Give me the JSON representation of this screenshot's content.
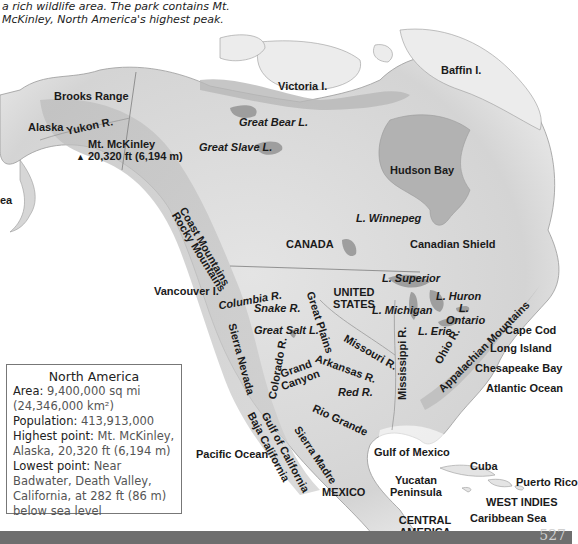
{
  "caption": {
    "text": "a rich wildlife area. The park contains Mt. McKinley, North America's highest peak."
  },
  "factbox": {
    "title": "North America",
    "area_label": "Area:",
    "area_value": "9,400,000 sq mi (24,346,000 km²)",
    "population_label": "Population:",
    "population_value": "413,913,000",
    "highest_label": "Highest point:",
    "highest_value": "Mt. McKinley, Alaska, 20,320 ft (6,194 m)",
    "lowest_label": "Lowest point:",
    "lowest_value": "Near Badwater, Death Valley, California, at 282 ft (86 m) below sea level"
  },
  "labels": {
    "victoria": "Victoria I.",
    "baffin": "Baffin I.",
    "brooks": "Brooks Range",
    "alaska": "Alaska",
    "yukon": "Yukon R.",
    "mckinley": "Mt. McKinley",
    "mckinley_elev": "20,320 ft (6,194 m)",
    "great_bear": "Great Bear L.",
    "great_slave": "Great Slave L.",
    "hudson": "Hudson Bay",
    "sea_partial": "ea",
    "rocky": "Rocky Mountains",
    "coast": "Coast Mountains",
    "winnepeg": "L. Winnepeg",
    "canada": "CANADA",
    "canadian_shield": "Canadian Shield",
    "vancouver": "Vancouver I.",
    "columbia": "Columbia R.",
    "snake": "Snake R.",
    "great_salt": "Great Salt L.",
    "sierra_nevada": "Sierra Nevada",
    "great_plains": "Great Plains",
    "united_states": "UNITED STATES",
    "superior": "L. Superior",
    "huron": "L. Huron",
    "ontario": "L. Ontario",
    "michigan": "L. Michigan",
    "erie": "L. Erie",
    "missouri": "Missouri R.",
    "mississippi": "Mississippi R.",
    "ohio": "Ohio R.",
    "appalachian": "Appalachian Mountains",
    "cape_cod": "Cape Cod",
    "long_island": "Long Island",
    "chesapeake": "Chesapeake Bay",
    "atlantic": "Atlantic Ocean",
    "colorado": "Colorado R.",
    "grand_canyon": "Grand Canyon",
    "arkansas": "Arkansas R.",
    "red": "Red R.",
    "rio_grande": "Rio Grande",
    "pacific": "Pacific Ocean",
    "baja": "Baja California",
    "gulf_california": "Gulf of California",
    "sierra_madre": "Sierra Madre",
    "gulf_mexico": "Gulf of Mexico",
    "mexico": "MEXICO",
    "yucatan": "Yucatan Peninsula",
    "cuba": "Cuba",
    "puerto_rico": "Puerto Rico",
    "west_indies": "WEST INDIES",
    "caribbean": "Caribbean Sea",
    "central_america": "CENTRAL AMERICA"
  },
  "page_number": "527",
  "colors": {
    "land": "#dcdcdc",
    "land_dark": "#b4b4b4",
    "water": "#a9a9a9",
    "footer": "#6e6e6e",
    "text": "#1a1a1a"
  }
}
